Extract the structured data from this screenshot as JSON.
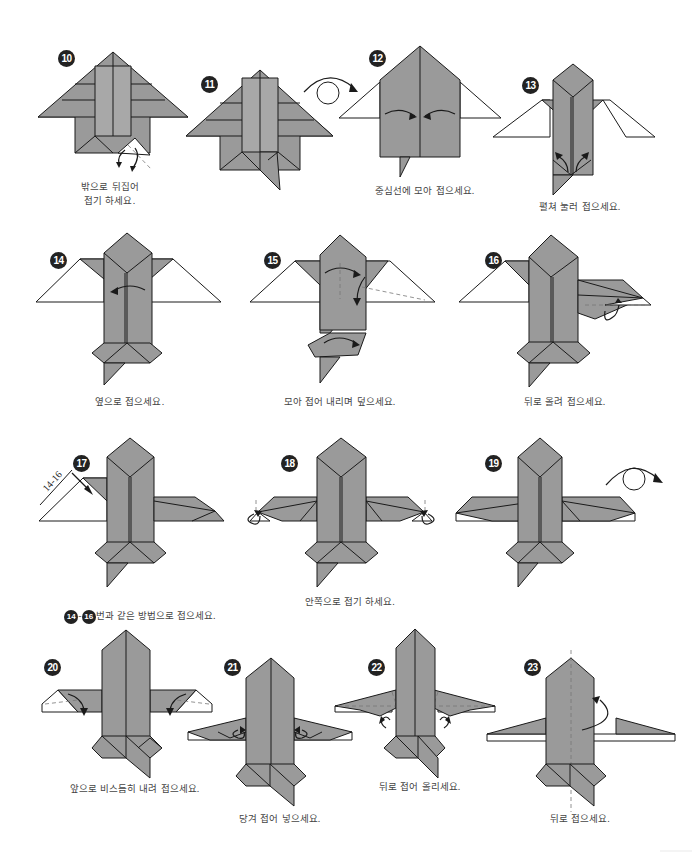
{
  "page": {
    "type": "origami-instruction-sheet",
    "colors": {
      "paper_gray": "#9a9a9a",
      "outline": "#1a1a1a",
      "badge": "#222222",
      "caption_text": "#444444"
    }
  },
  "steps": [
    {
      "number": "10",
      "caption": "밖으로 뒤집어\n접기 하세요."
    },
    {
      "number": "11",
      "caption": ""
    },
    {
      "number": "12",
      "caption": "중심선에 모아 접으세요."
    },
    {
      "number": "13",
      "caption": "펼쳐 눌러 접으세요."
    },
    {
      "number": "14",
      "caption": "옆으로 접으세요."
    },
    {
      "number": "15",
      "caption": "모아 접어 내리며 덮으세요."
    },
    {
      "number": "16",
      "caption": "뒤로 올려 접으세요."
    },
    {
      "number": "17",
      "caption_ref_from": "14",
      "caption_ref_to": "16",
      "caption_dash": "-",
      "caption": "번과 같은 방법으로 접으세요.",
      "side_label": "14-16"
    },
    {
      "number": "18",
      "caption": "안쪽으로 접기 하세요."
    },
    {
      "number": "19",
      "caption": ""
    },
    {
      "number": "20",
      "caption": "앞으로 비스듬히 내려 접으세요."
    },
    {
      "number": "21",
      "caption": "당겨 접어 넣으세요."
    },
    {
      "number": "22",
      "caption": "뒤로 접어 올리세요."
    },
    {
      "number": "23",
      "caption": "뒤로 접으세요."
    }
  ],
  "icons": {
    "turn_over": "turn-over-arrow-icon",
    "fold_arrow": "fold-arrow-icon",
    "valley_line": "dashed-fold-line"
  }
}
